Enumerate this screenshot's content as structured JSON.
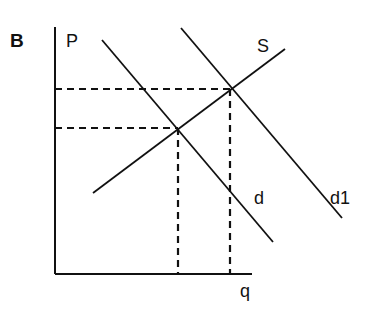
{
  "panel_label": "B",
  "axes": {
    "y_label": "P",
    "x_label": "q"
  },
  "curves": {
    "supply": {
      "label": "S"
    },
    "demand": {
      "label": "d"
    },
    "demand_shifted": {
      "label": "d1"
    }
  },
  "equilibria": [
    {
      "name": "original",
      "curves": [
        "S",
        "d"
      ]
    },
    {
      "name": "new",
      "curves": [
        "S",
        "d1"
      ]
    }
  ],
  "colors": {
    "line": "#111111",
    "background": "#ffffff"
  }
}
